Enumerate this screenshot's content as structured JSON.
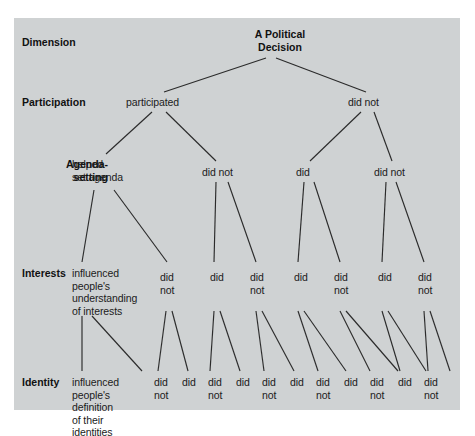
{
  "figure": {
    "background_color": "#cfd2d3",
    "line_color": "#2b2b2b",
    "text_color": "#1b1b1b"
  },
  "row_labels": [
    {
      "id": "dimension",
      "text": "Dimension",
      "x": 8,
      "y": 18,
      "w": 86,
      "align": "left"
    },
    {
      "id": "participation",
      "text": "Participation",
      "x": 8,
      "y": 78,
      "w": 86,
      "align": "left"
    },
    {
      "id": "agenda",
      "text": "Agenda-\nsetting",
      "x": 8,
      "y": 140,
      "w": 86,
      "align": "right"
    },
    {
      "id": "interests",
      "text": "Interests",
      "x": 8,
      "y": 249,
      "w": 86,
      "align": "left"
    },
    {
      "id": "identity",
      "text": "Identity",
      "x": 8,
      "y": 358,
      "w": 86,
      "align": "left"
    }
  ],
  "root": {
    "id": "root",
    "label": "A Political\nDecision",
    "x": 231,
    "y": 10,
    "w": 70
  },
  "level_participation": {
    "label": "Participation",
    "nodes": [
      {
        "id": "p1",
        "label": "participated",
        "x": 112,
        "y": 78,
        "w": 66
      },
      {
        "id": "p2",
        "label": "did not",
        "x": 334,
        "y": 78,
        "w": 44
      }
    ]
  },
  "level_agenda": {
    "label": "Agenda-setting",
    "nodes": [
      {
        "id": "a1",
        "label": "helped\nset agenda",
        "x": 58,
        "y": 140,
        "w": 70
      },
      {
        "id": "a2",
        "label": "did not",
        "x": 188,
        "y": 148,
        "w": 44
      },
      {
        "id": "a3",
        "label": "did",
        "x": 282,
        "y": 148,
        "w": 24
      },
      {
        "id": "a4",
        "label": "did not",
        "x": 360,
        "y": 148,
        "w": 44
      }
    ]
  },
  "level_interests": {
    "label": "Interests",
    "nodes": [
      {
        "id": "i1",
        "label": "influenced\npeople's\nunderstanding\nof interests",
        "x": 58,
        "y": 249,
        "w": 80
      },
      {
        "id": "i2",
        "label": "did\nnot",
        "x": 146,
        "y": 253,
        "w": 24
      },
      {
        "id": "i3",
        "label": "did",
        "x": 196,
        "y": 253,
        "w": 24
      },
      {
        "id": "i4",
        "label": "did\nnot",
        "x": 236,
        "y": 253,
        "w": 24
      },
      {
        "id": "i5",
        "label": "did",
        "x": 280,
        "y": 253,
        "w": 24
      },
      {
        "id": "i6",
        "label": "did\nnot",
        "x": 320,
        "y": 253,
        "w": 24
      },
      {
        "id": "i7",
        "label": "did",
        "x": 364,
        "y": 253,
        "w": 24
      },
      {
        "id": "i8",
        "label": "did\nnot",
        "x": 404,
        "y": 253,
        "w": 24
      }
    ]
  },
  "level_identity": {
    "label": "Identity",
    "nodes": [
      {
        "id": "d1",
        "label": "influenced\npeople's\ndefinition\nof their\nidentities",
        "x": 58,
        "y": 358,
        "w": 78
      },
      {
        "id": "d2",
        "label": "did\nnot",
        "x": 140,
        "y": 358,
        "w": 22
      },
      {
        "id": "d3",
        "label": "did",
        "x": 168,
        "y": 358,
        "w": 22
      },
      {
        "id": "d4",
        "label": "did\nnot",
        "x": 194,
        "y": 358,
        "w": 22
      },
      {
        "id": "d5",
        "label": "did",
        "x": 222,
        "y": 358,
        "w": 22
      },
      {
        "id": "d6",
        "label": "did\nnot",
        "x": 248,
        "y": 358,
        "w": 22
      },
      {
        "id": "d7",
        "label": "did",
        "x": 276,
        "y": 358,
        "w": 22
      },
      {
        "id": "d8",
        "label": "did\nnot",
        "x": 302,
        "y": 358,
        "w": 22
      },
      {
        "id": "d9",
        "label": "did",
        "x": 330,
        "y": 358,
        "w": 22
      },
      {
        "id": "d10",
        "label": "did\nnot",
        "x": 356,
        "y": 358,
        "w": 22
      },
      {
        "id": "d11",
        "label": "did",
        "x": 384,
        "y": 358,
        "w": 22
      },
      {
        "id": "d12",
        "label": "did\nnot",
        "x": 410,
        "y": 358,
        "w": 22
      }
    ]
  },
  "edges": [
    {
      "from": "root",
      "to": "p1",
      "x1": 252,
      "y1": 40,
      "x2": 150,
      "y2": 74
    },
    {
      "from": "root",
      "to": "p2",
      "x1": 262,
      "y1": 40,
      "x2": 352,
      "y2": 74
    },
    {
      "from": "p1",
      "to": "a1",
      "x1": 138,
      "y1": 94,
      "x2": 92,
      "y2": 136
    },
    {
      "from": "p1",
      "to": "a2",
      "x1": 152,
      "y1": 94,
      "x2": 202,
      "y2": 143
    },
    {
      "from": "p2",
      "to": "a3",
      "x1": 347,
      "y1": 94,
      "x2": 296,
      "y2": 143
    },
    {
      "from": "p2",
      "to": "a4",
      "x1": 360,
      "y1": 94,
      "x2": 378,
      "y2": 143
    },
    {
      "from": "a1",
      "to": "i1",
      "x1": 80,
      "y1": 172,
      "x2": 68,
      "y2": 244
    },
    {
      "from": "a1",
      "to": "i2",
      "x1": 100,
      "y1": 172,
      "x2": 153,
      "y2": 244
    },
    {
      "from": "a2",
      "to": "i3",
      "x1": 202,
      "y1": 164,
      "x2": 200,
      "y2": 244
    },
    {
      "from": "a2",
      "to": "i4",
      "x1": 214,
      "y1": 164,
      "x2": 242,
      "y2": 244
    },
    {
      "from": "a3",
      "to": "i5",
      "x1": 290,
      "y1": 164,
      "x2": 284,
      "y2": 244
    },
    {
      "from": "a3",
      "to": "i6",
      "x1": 300,
      "y1": 164,
      "x2": 326,
      "y2": 244
    },
    {
      "from": "a4",
      "to": "i7",
      "x1": 372,
      "y1": 164,
      "x2": 368,
      "y2": 244
    },
    {
      "from": "a4",
      "to": "i8",
      "x1": 382,
      "y1": 164,
      "x2": 410,
      "y2": 244
    },
    {
      "from": "i1",
      "to": "d1",
      "x1": 68,
      "y1": 298,
      "x2": 68,
      "y2": 353
    },
    {
      "from": "i1",
      "to": "d2",
      "x1": 78,
      "y1": 298,
      "x2": 128,
      "y2": 353
    },
    {
      "from": "i2",
      "to": "d3",
      "x1": 152,
      "y1": 293,
      "x2": 144,
      "y2": 353
    },
    {
      "from": "i2",
      "to": "d4",
      "x1": 158,
      "y1": 293,
      "x2": 174,
      "y2": 353
    },
    {
      "from": "i3",
      "to": "d5",
      "x1": 200,
      "y1": 293,
      "x2": 196,
      "y2": 353
    },
    {
      "from": "i3",
      "to": "d6",
      "x1": 206,
      "y1": 293,
      "x2": 226,
      "y2": 353
    },
    {
      "from": "i4",
      "to": "d7",
      "x1": 242,
      "y1": 293,
      "x2": 250,
      "y2": 353
    },
    {
      "from": "i4",
      "to": "d8",
      "x1": 248,
      "y1": 293,
      "x2": 280,
      "y2": 353
    },
    {
      "from": "i5",
      "to": "d9",
      "x1": 284,
      "y1": 293,
      "x2": 304,
      "y2": 353
    },
    {
      "from": "i5",
      "to": "d10",
      "x1": 290,
      "y1": 293,
      "x2": 332,
      "y2": 353
    },
    {
      "from": "i6",
      "to": "d11",
      "x1": 326,
      "y1": 293,
      "x2": 356,
      "y2": 353
    },
    {
      "from": "i6",
      "to": "d12",
      "x1": 332,
      "y1": 293,
      "x2": 384,
      "y2": 353
    },
    {
      "from": "i7",
      "to": "d11b",
      "x1": 368,
      "y1": 293,
      "x2": 386,
      "y2": 353
    },
    {
      "from": "i7",
      "to": "d12b",
      "x1": 374,
      "y1": 293,
      "x2": 412,
      "y2": 353
    },
    {
      "from": "i8",
      "to": "d12c",
      "x1": 410,
      "y1": 293,
      "x2": 414,
      "y2": 353
    },
    {
      "from": "i8",
      "to": "d12d",
      "x1": 416,
      "y1": 293,
      "x2": 436,
      "y2": 353
    }
  ]
}
